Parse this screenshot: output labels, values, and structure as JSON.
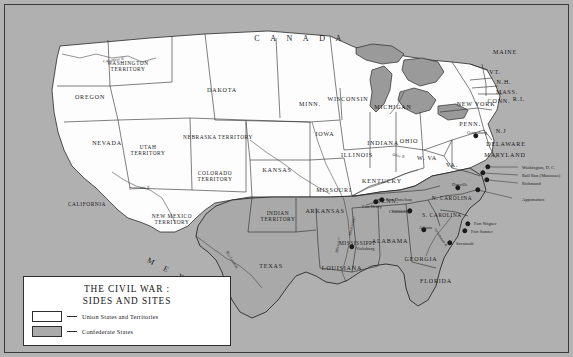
{
  "figure": {
    "title": "THE CIVIL WAR :",
    "subtitle": "SIDES AND SITES"
  },
  "legend": {
    "union_label": "Union States and Territories",
    "confederate_label": "Confederate States",
    "union_color": "#ffffff",
    "confederate_color": "#aaaaaa"
  },
  "colors": {
    "ocean": "#b0b0b0",
    "union_fill": "#fdfdfd",
    "confederate_fill": "#a9a9a9",
    "border": "#2a2a2a",
    "frame": "#3a3a3a",
    "lake": "#9a9a9a"
  },
  "countries": [
    {
      "name": "CANADA",
      "x": 300,
      "y": 38,
      "rotate": 0
    },
    {
      "name": "MEXICO",
      "x": 188,
      "y": 281,
      "rotate": 28
    }
  ],
  "states": [
    {
      "name": "WASHINGTON<br>TERRITORY",
      "x": 128,
      "y": 66,
      "side": "union"
    },
    {
      "name": "OREGON",
      "x": 90,
      "y": 97,
      "side": "union"
    },
    {
      "name": "DAKOTA",
      "x": 222,
      "y": 90,
      "side": "union"
    },
    {
      "name": "NEVADA",
      "x": 107,
      "y": 143,
      "side": "union"
    },
    {
      "name": "UTAH<br>TERRITORY",
      "x": 148,
      "y": 150,
      "side": "union"
    },
    {
      "name": "CALIFORNIA",
      "x": 87,
      "y": 204,
      "side": "union"
    },
    {
      "name": "NEW MEXICO<br>TERRITORY",
      "x": 172,
      "y": 219,
      "side": "union"
    },
    {
      "name": "COLORADO<br>TERRITORY",
      "x": 215,
      "y": 176,
      "side": "union"
    },
    {
      "name": "NEBRASKA TERRITORY",
      "x": 218,
      "y": 137,
      "side": "union"
    },
    {
      "name": "KANSAS",
      "x": 277,
      "y": 170,
      "side": "union"
    },
    {
      "name": "INDIAN<br>TERRITORY",
      "x": 278,
      "y": 216,
      "side": "confederate"
    },
    {
      "name": "TEXAS",
      "x": 271,
      "y": 266,
      "side": "confederate"
    },
    {
      "name": "MINN.",
      "x": 310,
      "y": 104,
      "side": "union"
    },
    {
      "name": "WISCONSIN",
      "x": 348,
      "y": 99,
      "side": "union"
    },
    {
      "name": "IOWA",
      "x": 325,
      "y": 134,
      "side": "union"
    },
    {
      "name": "MISSOURI",
      "x": 334,
      "y": 190,
      "side": "union"
    },
    {
      "name": "ARKANSAS",
      "x": 325,
      "y": 211,
      "side": "confederate"
    },
    {
      "name": "LOUISIANA",
      "x": 342,
      "y": 268,
      "side": "confederate"
    },
    {
      "name": "MISSISSIPPI",
      "x": 357,
      "y": 243,
      "side": "confederate"
    },
    {
      "name": "ALABAMA",
      "x": 390,
      "y": 241,
      "side": "confederate"
    },
    {
      "name": "GEORGIA",
      "x": 421,
      "y": 259,
      "side": "confederate"
    },
    {
      "name": "FLORIDA",
      "x": 436,
      "y": 281,
      "side": "confederate"
    },
    {
      "name": "ILLINOIS",
      "x": 357,
      "y": 155,
      "side": "union"
    },
    {
      "name": "INDIANA",
      "x": 383,
      "y": 143,
      "side": "union"
    },
    {
      "name": "MICHIGAN",
      "x": 393,
      "y": 107,
      "side": "union"
    },
    {
      "name": "OHIO",
      "x": 409,
      "y": 141,
      "side": "union"
    },
    {
      "name": "KENTUCKY",
      "x": 382,
      "y": 181,
      "side": "union"
    },
    {
      "name": "TENN.",
      "x": 388,
      "y": 201,
      "side": "confederate"
    },
    {
      "name": "W. VA",
      "x": 427,
      "y": 158,
      "side": "union"
    },
    {
      "name": "VA.",
      "x": 452,
      "y": 165,
      "side": "confederate"
    },
    {
      "name": "N. CAROLINA",
      "x": 452,
      "y": 198,
      "side": "confederate"
    },
    {
      "name": "S. CAROLINA",
      "x": 442,
      "y": 215,
      "side": "confederate"
    },
    {
      "name": "NEW YORK",
      "x": 476,
      "y": 104,
      "side": "union"
    },
    {
      "name": "PENN.",
      "x": 470,
      "y": 124,
      "side": "union"
    },
    {
      "name": "N.J",
      "x": 501,
      "y": 131,
      "side": "union"
    },
    {
      "name": "DELAWARE",
      "x": 506,
      "y": 144,
      "side": "union"
    },
    {
      "name": "MARYLAND",
      "x": 505,
      "y": 155,
      "side": "union"
    },
    {
      "name": "MAINE",
      "x": 505,
      "y": 52,
      "side": "union"
    },
    {
      "name": "VT.",
      "x": 495,
      "y": 72,
      "side": "union"
    },
    {
      "name": "N.H.",
      "x": 504,
      "y": 82,
      "side": "union"
    },
    {
      "name": "MASS.",
      "x": 507,
      "y": 92,
      "side": "union"
    },
    {
      "name": "CONN.",
      "x": 499,
      "y": 101,
      "side": "union"
    },
    {
      "name": "R.I.",
      "x": 519,
      "y": 99,
      "side": "union"
    }
  ],
  "rivers": [
    {
      "name": "Columbia R.",
      "x": 114,
      "y": 60,
      "rotate": -8
    },
    {
      "name": "Colorado R.",
      "x": 140,
      "y": 188,
      "rotate": -4
    },
    {
      "name": "Ohio R.",
      "x": 399,
      "y": 156,
      "rotate": 10
    },
    {
      "name": "Mississippi",
      "x": 352,
      "y": 226,
      "rotate": -78
    },
    {
      "name": "Missouri",
      "x": 338,
      "y": 245,
      "rotate": -80
    },
    {
      "name": "Rio Grande",
      "x": 232,
      "y": 260,
      "rotate": 58
    },
    {
      "name": "Savannah R.",
      "x": 441,
      "y": 238,
      "rotate": 58
    }
  ],
  "sites": [
    {
      "name": "Gettysburg",
      "x": 476,
      "y": 136,
      "dx": 477,
      "dy": 132,
      "align": "center"
    },
    {
      "name": "Washington, D. C.",
      "x": 488,
      "y": 167,
      "dx": 522,
      "dy": 167,
      "align": "left"
    },
    {
      "name": "Bull Run  (Manassas)",
      "x": 483,
      "y": 173,
      "dx": 522,
      "dy": 175,
      "align": "left"
    },
    {
      "name": "Richmond",
      "x": 487,
      "y": 180,
      "dx": 522,
      "dy": 183,
      "align": "left"
    },
    {
      "name": "Appomattox",
      "x": 478,
      "y": 190,
      "dx": 522,
      "dy": 199,
      "align": "left"
    },
    {
      "name": "Danville",
      "x": 458,
      "y": 188,
      "dx": 452,
      "dy": 184,
      "align": "left"
    },
    {
      "name": "Fort Wagner",
      "x": 468,
      "y": 224,
      "dx": 474,
      "dy": 223,
      "align": "left"
    },
    {
      "name": "Fort Sumter",
      "x": 465,
      "y": 231,
      "dx": 471,
      "dy": 231,
      "align": "left"
    },
    {
      "name": "Savannah",
      "x": 450,
      "y": 243,
      "dx": 456,
      "dy": 243,
      "align": "left"
    },
    {
      "name": "Atlanta",
      "x": 424,
      "y": 230,
      "dx": 419,
      "dy": 227,
      "align": "left"
    },
    {
      "name": "Chattanooga",
      "x": 410,
      "y": 211,
      "dx": 389,
      "dy": 211,
      "align": "left"
    },
    {
      "name": "Fort Donelson",
      "x": 382,
      "y": 200,
      "dx": 386,
      "dy": 199,
      "align": "left"
    },
    {
      "name": "Fort Henry",
      "x": 376,
      "y": 202,
      "dx": 362,
      "dy": 206,
      "align": "left"
    },
    {
      "name": "Vicksburg",
      "x": 352,
      "y": 247,
      "dx": 356,
      "dy": 248,
      "align": "left"
    }
  ]
}
